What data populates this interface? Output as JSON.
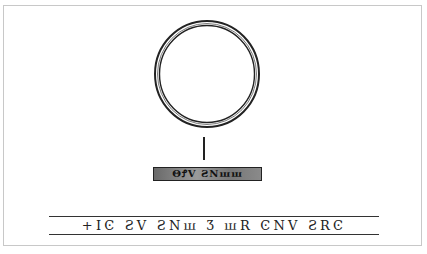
{
  "figure": {
    "ring": {
      "shape": "circle",
      "stroke_color": "#222222"
    },
    "bezel_inscription": "ΘꝬV ƧNꟺꟺ",
    "band_inscription": "+IϾ ƧV ƧNꟺ Ʒ ꟺR ϾNV ƧRϾ",
    "colors": {
      "frame": "#c8c8c8",
      "ink": "#222222",
      "background": "#ffffff"
    }
  }
}
